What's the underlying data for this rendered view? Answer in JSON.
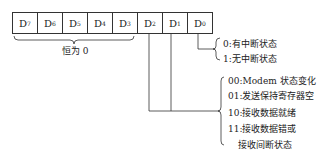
{
  "register": {
    "bits": [
      {
        "name": "D",
        "index": "7"
      },
      {
        "name": "D",
        "index": "6"
      },
      {
        "name": "D",
        "index": "5"
      },
      {
        "name": "D",
        "index": "4"
      },
      {
        "name": "D",
        "index": "3"
      },
      {
        "name": "D",
        "index": "2"
      },
      {
        "name": "D",
        "index": "1"
      },
      {
        "name": "D",
        "index": "0"
      }
    ]
  },
  "annotations": {
    "high_bits_label": "恒为 0",
    "d0_options": [
      "0:有中断状态",
      "1:无中断状态"
    ],
    "d2d1_options": [
      "00:Modem 状态变化",
      "01:发送保持寄存器空",
      "10:接收数据就绪",
      "11:接收数据错或",
      "接收间断状态"
    ]
  }
}
